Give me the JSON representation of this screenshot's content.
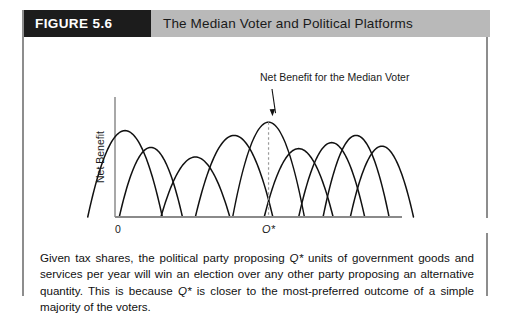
{
  "figure": {
    "number_label": "FIGURE 5.6",
    "title": "The Median Voter and Political Platforms",
    "number_bg": "#1c1c1c",
    "title_bg": "#b9b9b9"
  },
  "chart_data": {
    "type": "line",
    "title": "The Median Voter and Political Platforms",
    "xlabel": "Output of Government Goods and Services per Year",
    "ylabel": "Net Benefit",
    "x_origin_label": "0",
    "median_tick_label": "Q*",
    "grid": false,
    "legend": null,
    "annotations": [
      {
        "text": "Net Benefit for the Median Voter",
        "points_to": "median-voter-curve-peak",
        "arrow": true
      }
    ],
    "axis_ranges": {
      "xlim": [
        0,
        100
      ],
      "ylim": [
        0,
        100
      ]
    },
    "series_note": "Each curve is a single voter's inverted-U net-benefit function peaking at that voter's most-preferred output.",
    "series": [
      {
        "name": "voter-1",
        "peak_x": 3.5,
        "half_width": 13.0,
        "peak_y": 72,
        "median": false
      },
      {
        "name": "voter-2",
        "peak_x": 12.5,
        "half_width": 11.0,
        "peak_y": 58,
        "median": false
      },
      {
        "name": "voter-3",
        "peak_x": 28.0,
        "half_width": 12.0,
        "peak_y": 50,
        "median": false
      },
      {
        "name": "voter-4",
        "peak_x": 41.5,
        "half_width": 13.5,
        "peak_y": 68,
        "median": false
      },
      {
        "name": "median-voter",
        "peak_x": 53.5,
        "half_width": 12.5,
        "peak_y": 79,
        "median": true
      },
      {
        "name": "voter-6",
        "peak_x": 64.0,
        "half_width": 12.0,
        "peak_y": 57,
        "median": false
      },
      {
        "name": "voter-7",
        "peak_x": 75.5,
        "half_width": 11.5,
        "peak_y": 62,
        "median": false
      },
      {
        "name": "voter-8",
        "peak_x": 84.0,
        "half_width": 11.5,
        "peak_y": 68,
        "median": false
      },
      {
        "name": "voter-9",
        "peak_x": 93.0,
        "half_width": 11.0,
        "peak_y": 59,
        "median": false
      }
    ],
    "median_marker_x": 53.5
  },
  "caption": {
    "line1": "Given tax shares, the political party proposing ",
    "q1": "Q*",
    "line2": " units of government goods and services per year will win an election over any other party proposing an alternative quantity. This is because ",
    "q2": "Q*",
    "line3": " is closer to the most-preferred outcome of a simple majority of the voters."
  }
}
